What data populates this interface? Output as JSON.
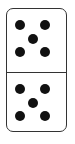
{
  "domino": {
    "top_value": 5,
    "bottom_value": 5,
    "pip_color": "#111111",
    "border_color": "#333333",
    "face_color": "#ffffff"
  }
}
